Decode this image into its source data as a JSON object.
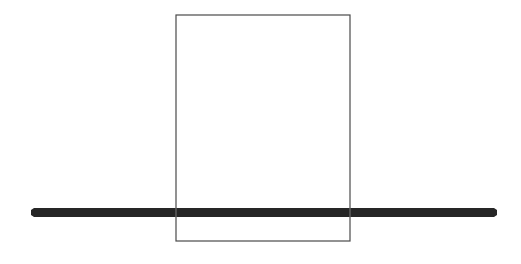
{
  "canvas": {
    "width": 521,
    "height": 264,
    "background_color": "#ffffff",
    "description": "minimal line drawing"
  },
  "figure": {
    "title": "",
    "shapes": [
      {
        "id": "rectangle-outline",
        "name": "rectangle-outline",
        "type": "rect",
        "x": 176,
        "y": 15,
        "width": 174,
        "height": 226,
        "fill": "none",
        "stroke_color": "#4a4a4a",
        "stroke_width": 1.2
      },
      {
        "id": "horizontal-bar",
        "name": "horizontal-bar",
        "type": "bar",
        "x": 31,
        "y": 208,
        "width": 466,
        "height": 9,
        "fill": "#262626",
        "stroke_color": "none",
        "stroke_width": 0,
        "taper": 2
      },
      {
        "id": "rectangle-left-edge-overlay",
        "name": "rectangle-left-edge-overlay",
        "type": "line",
        "x1": 176,
        "y1": 208,
        "x2": 176,
        "y2": 217,
        "stroke_color": "#5f5f5f",
        "stroke_width": 1.2
      },
      {
        "id": "rectangle-right-edge-overlay",
        "name": "rectangle-right-edge-overlay",
        "type": "line",
        "x1": 350,
        "y1": 208,
        "x2": 350,
        "y2": 217,
        "stroke_color": "#5f5f5f",
        "stroke_width": 1.2
      }
    ]
  },
  "colors": {
    "background": "#ffffff",
    "outline_stroke": "#4a4a4a",
    "bar_fill": "#262626",
    "overlay_stroke": "#5f5f5f"
  }
}
